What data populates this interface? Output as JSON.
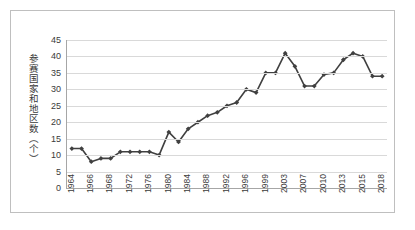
{
  "chart_data": {
    "type": "line",
    "title": "",
    "xlabel": "",
    "ylabel": "参赛国家和地区数（个）",
    "ylim": [
      0,
      45
    ],
    "ytick_step": 5,
    "ytick_labels": [
      "45",
      "40",
      "35",
      "30",
      "25",
      "20",
      "15",
      "10",
      "5",
      "0"
    ],
    "grid": true,
    "legend": "none",
    "marker": "diamond",
    "series_color": "#404040",
    "gridline_color": "#d9d9d9",
    "axis_color": "#a6a6a6",
    "x_tick_labels": [
      "1964",
      "1966",
      "1968",
      "1972",
      "1976",
      "1980",
      "1984",
      "1988",
      "1992",
      "1996",
      "1999",
      "2003",
      "2007",
      "2010",
      "2013",
      "2015",
      "2018"
    ],
    "x_tick_indices": [
      0,
      2,
      4,
      6,
      8,
      10,
      12,
      14,
      16,
      18,
      20,
      22,
      24,
      26,
      28,
      30,
      32
    ],
    "x": [
      "1964",
      "1965",
      "1966",
      "1967",
      "1968",
      "1970",
      "1972",
      "1974",
      "1976",
      "1978",
      "1980",
      "1982",
      "1984",
      "1986",
      "1988",
      "1990",
      "1992",
      "1994",
      "1996",
      "1998",
      "1999",
      "2001",
      "2003",
      "2005",
      "2007",
      "2009",
      "2010",
      "2012",
      "2013",
      "2014",
      "2015",
      "2017",
      "2018"
    ],
    "values": [
      12,
      12,
      8,
      9,
      9,
      11,
      11,
      11,
      11,
      10,
      17,
      14,
      18,
      20,
      22,
      23,
      25,
      26,
      30,
      29,
      35,
      35,
      41,
      37,
      31,
      31,
      34.5,
      35,
      39,
      41,
      40,
      34,
      34
    ]
  }
}
